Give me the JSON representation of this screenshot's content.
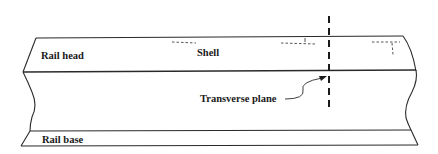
{
  "diagram": {
    "labels": {
      "rail_head": "Rail head",
      "shell": "Shell",
      "transverse_plane": "Transverse plane",
      "rail_base": "Rail base"
    },
    "colors": {
      "line": "#2a2a2a",
      "background": "#ffffff"
    }
  }
}
